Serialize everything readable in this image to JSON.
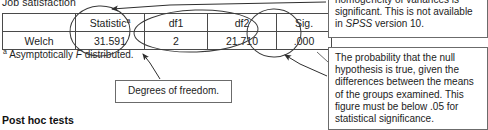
{
  "caption": {
    "text": "Job satisfaction"
  },
  "table": {
    "name": "robust-tests-of-equality-of-means",
    "headers": [
      "",
      "Statistic",
      "df1",
      "df2",
      "Sig."
    ],
    "header_superscript": "a",
    "rows": [
      {
        "label": "Welch",
        "statistic": "31.591",
        "df1": "2",
        "df2": "21.710",
        "sig": ".000"
      }
    ]
  },
  "footnote": {
    "marker": "a",
    "text_before": " Asymptotically ",
    "italic": "F",
    "text_after": " distributed."
  },
  "annotations": {
    "top_right": {
      "line1": "homogeneity of variances is",
      "line2": "significant.  This is not available",
      "line3_before": "in ",
      "line3_italic": "SPSS",
      "line3_after": " version 10."
    },
    "degrees_of_freedom": {
      "text": "Degrees of freedom."
    },
    "bottom_right": {
      "text": "The probability that the null hypothesis is true, given the differences between the means of the groups examined.  This figure must be below .05 for statistical significance."
    }
  },
  "section_heading": {
    "text": "Post hoc tests"
  },
  "colors": {
    "ink": "#1c1c1c",
    "table_border": "#4a4a4a",
    "callout_border": "#6b6b6b",
    "annotation_stroke": "#3a3a3a",
    "page_background": "#ffffff"
  }
}
